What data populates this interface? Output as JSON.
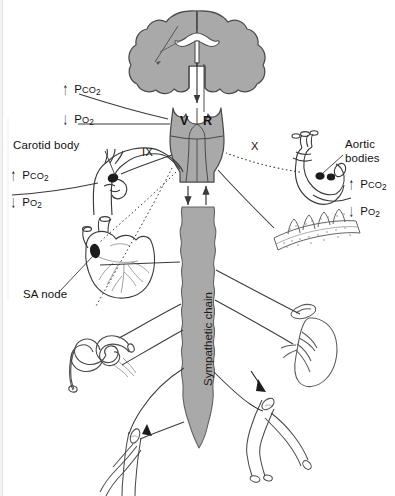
{
  "figure": {
    "background_color": "#ffffff",
    "structure_fill": "#a9a9a9",
    "structure_stroke": "#4a4a4a",
    "line_color": "#3a3a3a",
    "text_color": "#111111"
  },
  "labels": {
    "carotid_body": "Carotid body",
    "aortic_bodies_line1": "Aortic",
    "aortic_bodies_line2": "bodies",
    "sa_node": "SA node",
    "sympathetic_chain": "Sympathetic chain",
    "vasomotor_center": "V",
    "respiratory_center": "R",
    "nerve_ix": "IX",
    "nerve_x": "X"
  },
  "chemoreceptor_readouts": [
    {
      "id": "central-upper",
      "group": "central-chemoreceptor",
      "position": "top-left",
      "items": [
        {
          "arrow": "up",
          "arrow_glyph": "↑",
          "gas": "Pco",
          "subscript": "2",
          "text": "Pco2"
        },
        {
          "arrow": "down",
          "arrow_glyph": "↓",
          "gas": "Po",
          "subscript": "2",
          "text": "Po2"
        }
      ]
    },
    {
      "id": "carotid-body",
      "group": "peripheral-chemoreceptor",
      "position": "mid-left",
      "items": [
        {
          "arrow": "up",
          "arrow_glyph": "↑",
          "gas": "Pco",
          "subscript": "2",
          "text": "Pco2"
        },
        {
          "arrow": "down",
          "arrow_glyph": "↓",
          "gas": "Po",
          "subscript": "2",
          "text": "Po2"
        }
      ]
    },
    {
      "id": "aortic-bodies",
      "group": "peripheral-chemoreceptor",
      "position": "mid-right",
      "items": [
        {
          "arrow": "up",
          "arrow_glyph": "↑",
          "gas": "Pco",
          "subscript": "2",
          "text": "Pco2"
        },
        {
          "arrow": "down",
          "arrow_glyph": "↓",
          "gas": "Po",
          "subscript": "2",
          "text": "Po2"
        }
      ]
    }
  ],
  "anatomy": [
    {
      "name": "brain",
      "description": "coronal section of cerebrum with lateral ventricles",
      "fill": "#a9a9a9"
    },
    {
      "name": "medulla",
      "description": "brainstem containing vasomotor (V) and respiratory (R) centres",
      "fill": "#a9a9a9"
    },
    {
      "name": "spinal-cord",
      "description": "spinal cord descending from medulla",
      "fill": "#a9a9a9"
    },
    {
      "name": "sympathetic-chain",
      "description": "paravertebral sympathetic ganglion chain",
      "fill": "#a9a9a9"
    },
    {
      "name": "carotid-bifurcation",
      "description": "common carotid artery dividing into internal and external carotid with carotid body",
      "fill": "#ffffff"
    },
    {
      "name": "aortic-arch",
      "description": "aortic arch with aortic bodies",
      "fill": "#ffffff"
    },
    {
      "name": "heart",
      "description": "heart showing SA node and coronary vessels",
      "fill": "#ffffff"
    },
    {
      "name": "lung-alveoli",
      "description": "alveolar / bronchial epithelium",
      "fill": "#ffffff"
    },
    {
      "name": "kidney",
      "description": "kidney with adrenal gland",
      "fill": "#ffffff"
    },
    {
      "name": "intestine",
      "description": "coiled segment of gut",
      "fill": "#ffffff"
    },
    {
      "name": "arteriole-left",
      "description": "branching arteriole, lower left",
      "fill": "#ffffff"
    },
    {
      "name": "arteriole-right",
      "description": "branching arteriole, lower right",
      "fill": "#ffffff"
    }
  ],
  "pathways": [
    {
      "name": "brain-to-medulla",
      "style": "solid",
      "from": "brain",
      "to": "medulla"
    },
    {
      "name": "central-chemoreceptor-to-medulla",
      "style": "solid",
      "from": "central-chemoreceptor",
      "to": "medulla"
    },
    {
      "name": "carotid-body-to-medulla-ix",
      "style": "solid",
      "from": "carotid-body",
      "to": "medulla",
      "nerve": "IX"
    },
    {
      "name": "aortic-bodies-to-medulla-x",
      "style": "dotted",
      "from": "aortic-bodies",
      "to": "medulla",
      "nerve": "X"
    },
    {
      "name": "medulla-to-heart-vagal",
      "style": "dotted",
      "from": "medulla",
      "to": "heart"
    },
    {
      "name": "medulla-to-gut-vagal",
      "style": "dotted",
      "from": "medulla",
      "to": "intestine"
    },
    {
      "name": "medulla-to-spinal-cord",
      "style": "solid",
      "from": "medulla",
      "to": "spinal-cord"
    },
    {
      "name": "spinal-cord-to-medulla-afferent",
      "style": "solid",
      "from": "spinal-cord",
      "to": "medulla"
    },
    {
      "name": "chain-to-heart",
      "style": "solid",
      "from": "sympathetic-chain",
      "to": "heart"
    },
    {
      "name": "chain-to-lung",
      "style": "solid",
      "from": "sympathetic-chain",
      "to": "lung-alveoli"
    },
    {
      "name": "chain-to-kidney",
      "style": "solid",
      "from": "sympathetic-chain",
      "to": "kidney"
    },
    {
      "name": "chain-to-adrenal",
      "style": "solid",
      "from": "sympathetic-chain",
      "to": "kidney"
    },
    {
      "name": "chain-to-intestine",
      "style": "solid",
      "from": "sympathetic-chain",
      "to": "intestine"
    },
    {
      "name": "chain-to-arteriole-left",
      "style": "solid",
      "from": "sympathetic-chain",
      "to": "arteriole-left"
    },
    {
      "name": "chain-to-arteriole-right",
      "style": "solid",
      "from": "sympathetic-chain",
      "to": "arteriole-right"
    }
  ]
}
